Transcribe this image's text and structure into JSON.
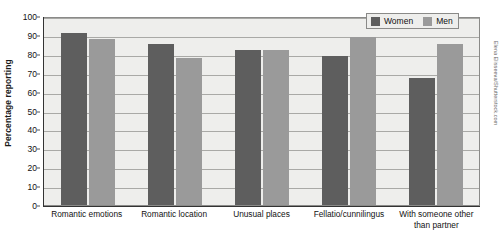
{
  "chart_data": {
    "type": "bar",
    "title": "",
    "xlabel": "",
    "ylabel": "Percentage reporting",
    "ylim": [
      0,
      100
    ],
    "ytick_step": 10,
    "yticks": [
      100,
      90,
      80,
      70,
      60,
      50,
      40,
      30,
      20,
      10,
      0
    ],
    "grid": true,
    "legend_position": "top-right",
    "categories": [
      "Romantic emotions",
      "Romantic location",
      "Unusual places",
      "Fellatio/cunnilingus",
      "With someone other than partner"
    ],
    "series": [
      {
        "name": "Women",
        "color": "#5e5e5e",
        "values": [
          91,
          85,
          82,
          79,
          67
        ]
      },
      {
        "name": "Men",
        "color": "#9a9a9a",
        "values": [
          88,
          78,
          82,
          89,
          85
        ]
      }
    ]
  },
  "legend": {
    "entries": [
      {
        "label": "Women",
        "swatch": "women-swatch-icon"
      },
      {
        "label": "Men",
        "swatch": "men-swatch-icon"
      }
    ]
  },
  "credit": {
    "text": "Elena Elisseeva/Shutterstock.com"
  },
  "colors": {
    "women": "#5e5e5e",
    "men": "#9a9a9a",
    "plot_background": "#eeeeec",
    "gridline": "#a9a9a6",
    "axis": "#333333",
    "text": "#111111"
  }
}
